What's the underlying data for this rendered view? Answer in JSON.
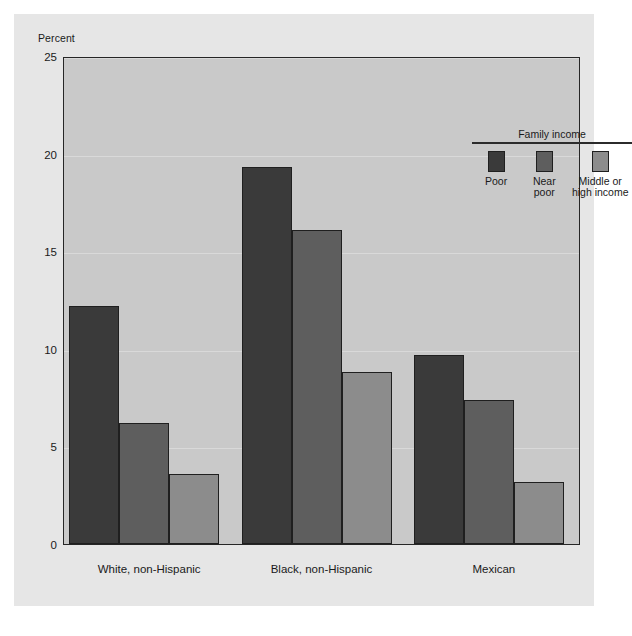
{
  "chart_data": {
    "type": "bar",
    "title": "",
    "xlabel": "",
    "ylabel": "Percent",
    "ylim": [
      0,
      25
    ],
    "yticks": [
      0,
      5,
      10,
      15,
      20,
      25
    ],
    "ytick_labels": [
      "0",
      "5",
      "10",
      "15",
      "20",
      "25"
    ],
    "grid": true,
    "grid_axis": "y",
    "legend_title": "Family income",
    "legend_position": "upper right inside plot",
    "categories": [
      "White, non-Hispanic",
      "Black, non-Hispanic",
      "Mexican"
    ],
    "series": [
      {
        "name": "Poor",
        "values": [
          12.2,
          19.3,
          9.7
        ],
        "color": "#3a3a3a"
      },
      {
        "name": "Near poor",
        "values": [
          6.2,
          16.1,
          7.4
        ],
        "color": "#5e5e5e"
      },
      {
        "name": "Middle or high income",
        "values": [
          3.6,
          8.8,
          3.2
        ],
        "color": "#8c8c8c"
      }
    ]
  },
  "legend": {
    "title": "Family income",
    "items": [
      {
        "label": "Poor",
        "color": "#3a3a3a"
      },
      {
        "label": "Near\npoor",
        "color": "#5e5e5e"
      },
      {
        "label": "Middle or\nhigh income",
        "color": "#8c8c8c"
      }
    ]
  },
  "axis": {
    "y_title": "Percent",
    "y_tick_labels": [
      "25",
      "20",
      "15",
      "10",
      "5",
      "0"
    ]
  },
  "x_labels": [
    "White, non-Hispanic",
    "Black, non-Hispanic",
    "Mexican"
  ],
  "colors": {
    "page_background": "#ffffff",
    "card_background": "#e6e6e6",
    "plot_background": "#c9c9c9",
    "plot_border": "#262626",
    "gridline": "#d9d9d9",
    "text": "#1a1a1a",
    "bar_poor": "#3a3a3a",
    "bar_near_poor": "#5e5e5e",
    "bar_middle_high": "#8c8c8c"
  }
}
